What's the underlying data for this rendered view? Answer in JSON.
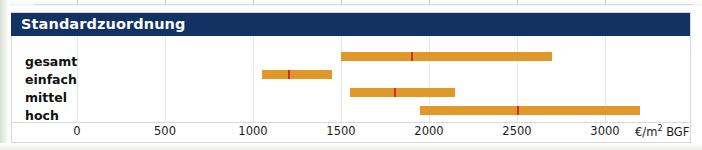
{
  "panel": {
    "title": "Standardzuordnung"
  },
  "chart_data": {
    "type": "bar",
    "title": "Standardzuordnung",
    "xlabel": "€/m² BGF",
    "ylabel": "",
    "xlim": [
      0,
      3350
    ],
    "grid": true,
    "legend": "none",
    "unit_label": "€/m² BGF",
    "xticks": [
      0,
      500,
      1000,
      1500,
      2000,
      2500,
      3000
    ],
    "xticklabels": [
      "0",
      "500",
      "1000",
      "1500",
      "2000",
      "2500",
      "3000"
    ],
    "categories": [
      "gesamt",
      "einfach",
      "mittel",
      "hoch"
    ],
    "bar_color": "#E0982A",
    "marker_color": "#D4311C",
    "header_color": "#123264",
    "ranges": [
      {
        "label": "gesamt",
        "low": 1500,
        "high": 2700,
        "marker": 1900
      },
      {
        "label": "einfach",
        "low": 1050,
        "high": 1450,
        "marker": 1200
      },
      {
        "label": "mittel",
        "low": 1550,
        "high": 2150,
        "marker": 1800
      },
      {
        "label": "hoch",
        "low": 1950,
        "high": 3200,
        "marker": 2500
      }
    ]
  }
}
